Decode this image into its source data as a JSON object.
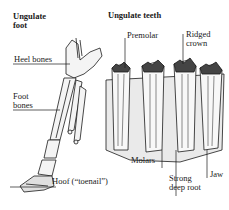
{
  "foot": {
    "title_line1": "Ungulate",
    "title_line2": "foot",
    "labels": {
      "heel": "Heel bones",
      "foot_line1": "Foot",
      "foot_line2": "bones",
      "hoof": "Hoof (“toenail”)"
    }
  },
  "teeth": {
    "title": "Ungulate teeth",
    "labels": {
      "premolar": "Premolar",
      "ridged_line1": "Ridged",
      "ridged_line2": "crown",
      "molars": "Molars",
      "jaw": "Jaw",
      "root_line1": "Strong",
      "root_line2": "deep root"
    }
  },
  "colors": {
    "ink": "#1a1a1a",
    "background": "#ffffff",
    "shade": "#bdbdbd"
  }
}
